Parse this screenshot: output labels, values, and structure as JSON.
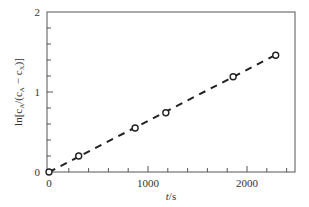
{
  "chart_data": {
    "type": "scatter",
    "title": "",
    "xlabel": "t/s",
    "ylabel": "ln[c_A/(c_A − c_X)]",
    "xlim": [
      0,
      2500
    ],
    "ylim": [
      0,
      2
    ],
    "x_ticks": [
      0,
      1000,
      2000
    ],
    "x_tick_labels": [
      "0",
      "1000",
      "2000"
    ],
    "y_ticks": [
      0,
      1,
      2
    ],
    "y_tick_labels": [
      "0",
      "1",
      "2"
    ],
    "x_minor_step": 200,
    "y_minor_step": 0.2,
    "grid": false,
    "legend": null,
    "series": [
      {
        "name": "measured",
        "marker": "open-circle",
        "x": [
          0,
          300,
          870,
          1180,
          1860,
          2290
        ],
        "y": [
          0.0,
          0.2,
          0.55,
          0.74,
          1.19,
          1.46
        ]
      },
      {
        "name": "linear fit",
        "style": "dashed",
        "x": [
          0,
          2300
        ],
        "y": [
          0.0,
          1.47
        ]
      }
    ]
  },
  "labels": {
    "xlabel_italic": "t",
    "xlabel_rest": "/s",
    "ylabel_text": "ln[c",
    "ylabel_sub_a": "A",
    "ylabel_mid": "/(c",
    "ylabel_sub_a2": "A",
    "ylabel_minus": " − c",
    "ylabel_sub_x": "X",
    "ylabel_end": ")]"
  }
}
